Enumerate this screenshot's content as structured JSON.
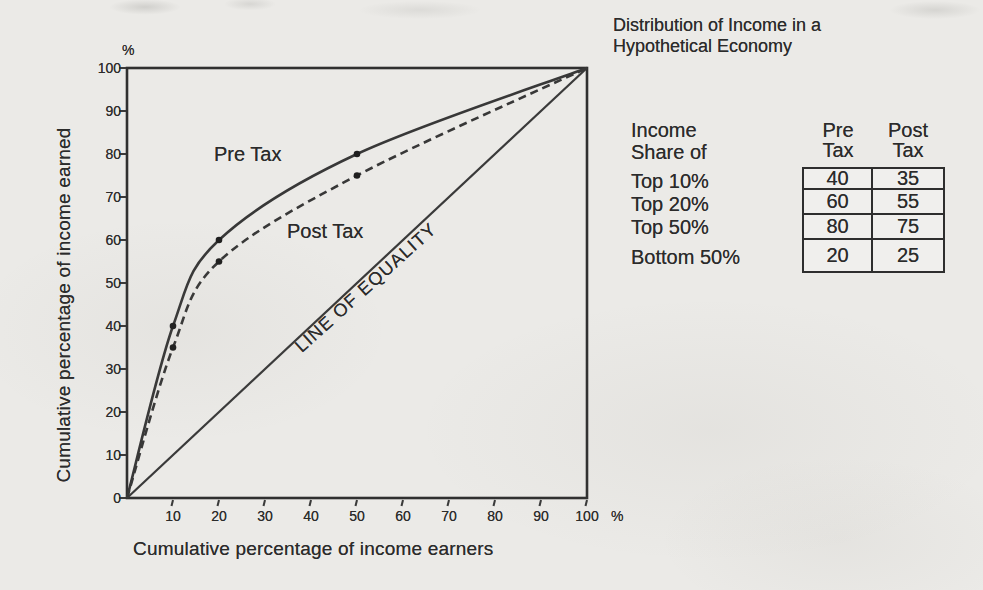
{
  "scan": {
    "background": "#ebeae7",
    "ink": "#2b2b2b",
    "line_color": "#383838"
  },
  "title": {
    "line1": "Distribution of Income in a",
    "line2": "Hypothetical Economy"
  },
  "chart_data": {
    "type": "line",
    "title": "Distribution of Income in a Hypothetical Economy",
    "xlabel": "Cumulative percentage of income earners",
    "ylabel": "Cumulative percentage of income earned",
    "axis_unit": "%",
    "xlim": [
      0,
      100
    ],
    "ylim": [
      0,
      100
    ],
    "x_ticks": [
      10,
      20,
      30,
      40,
      50,
      60,
      70,
      80,
      90,
      100
    ],
    "y_ticks": [
      0,
      10,
      20,
      30,
      40,
      50,
      60,
      70,
      80,
      90,
      100
    ],
    "grid": false,
    "legend_position": "in-plot-labels",
    "series": [
      {
        "name": "Pre Tax",
        "line_style": "solid",
        "points": [
          [
            0,
            0
          ],
          [
            10,
            40
          ],
          [
            20,
            60
          ],
          [
            50,
            80
          ],
          [
            100,
            100
          ]
        ],
        "markers": [
          [
            10,
            40
          ],
          [
            20,
            60
          ],
          [
            50,
            80
          ]
        ]
      },
      {
        "name": "Post Tax",
        "line_style": "dashed",
        "points": [
          [
            0,
            0
          ],
          [
            10,
            35
          ],
          [
            20,
            55
          ],
          [
            50,
            75
          ],
          [
            100,
            100
          ]
        ],
        "markers": [
          [
            10,
            35
          ],
          [
            20,
            55
          ],
          [
            50,
            75
          ]
        ]
      },
      {
        "name": "LINE OF EQUALITY",
        "line_style": "straight",
        "points": [
          [
            0,
            0
          ],
          [
            100,
            100
          ]
        ],
        "markers": []
      }
    ],
    "labels": {
      "pre_tax": "Pre Tax",
      "post_tax": "Post Tax",
      "equality": "LINE OF EQUALITY"
    }
  },
  "table": {
    "row_header": {
      "line1": "Income",
      "line2": "Share of"
    },
    "col_headers": [
      {
        "line1": "Pre",
        "line2": "Tax"
      },
      {
        "line1": "Post",
        "line2": "Tax"
      }
    ],
    "rows": [
      {
        "label": "Top 10%",
        "pre": "40",
        "post": "35"
      },
      {
        "label": "Top 20%",
        "pre": "60",
        "post": "55"
      },
      {
        "label": "Top 50%",
        "pre": "80",
        "post": "75"
      },
      {
        "label": "Bottom 50%",
        "pre": "20",
        "post": "25"
      }
    ]
  }
}
